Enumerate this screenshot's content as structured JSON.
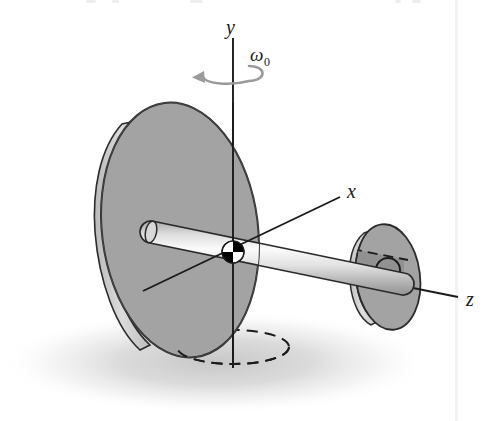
{
  "figure": {
    "kind": "physics-mechanics-diagram",
    "background_color": "#ffffff",
    "width": 501,
    "height": 421
  },
  "labels": {
    "y_axis": "y",
    "x_axis": "x",
    "z_axis": "z",
    "omega": "ω",
    "omega_subscript": "0"
  },
  "colors": {
    "disk_face": "#a3a3a3",
    "disk_face_shaded": "#8e8e8e",
    "disk_rim": "#c9c9c9",
    "disk_outline": "#2a2a2a",
    "shaft_light": "#f2f2f2",
    "shaft_mid": "#c4c4c4",
    "shaft_dark": "#9a9a9a",
    "shaft_outline": "#2a2a2a",
    "axis_line": "#1b1b1b",
    "rotation_arrow": "#9b9b9b",
    "shadow": "#d5d5d5",
    "com_black": "#000000",
    "com_white": "#ffffff",
    "scan_artifact": "#f4f4f4"
  },
  "geometry": {
    "large_disk": {
      "center_x": 180,
      "center_y": 230,
      "radius_x": 78,
      "radius_y": 128,
      "rotation_deg": -7
    },
    "small_disk": {
      "center_x": 388,
      "center_y": 277,
      "radius_x": 32,
      "radius_y": 53,
      "rotation_deg": -7
    },
    "shaft": {
      "start_x": 150,
      "start_y": 232,
      "end_x": 404,
      "end_y": 284,
      "half_thickness": 11
    },
    "center_of_mass_marker": {
      "x": 233,
      "y": 252,
      "radius": 11
    },
    "y_axis": {
      "x": 233,
      "top_y": 38,
      "bottom_y": 368
    },
    "x_axis": {
      "x1": 143,
      "y1": 291,
      "x2": 340,
      "y2": 197
    },
    "z_axis": {
      "x1": 233,
      "y1": 252,
      "x2": 458,
      "y2": 297
    },
    "precession_ellipse": {
      "center_x": 233,
      "center_y": 347,
      "radius_x": 56,
      "radius_y": 17
    },
    "rotation_arrow": {
      "center_x": 233,
      "center_y": 73,
      "radius_x": 32,
      "radius_y": 10
    },
    "ground_shadow": {
      "center_x": 215,
      "center_y": 362,
      "radius_x": 215,
      "radius_y": 52
    }
  },
  "label_positions": {
    "y": {
      "x": 226,
      "y": 34
    },
    "omega": {
      "x": 250,
      "y": 60
    },
    "x": {
      "x": 347,
      "y": 198
    },
    "z": {
      "x": 466,
      "y": 306
    }
  }
}
